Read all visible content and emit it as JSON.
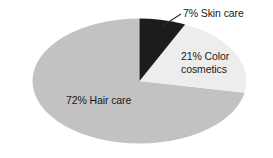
{
  "chart_data": {
    "type": "pie",
    "title": "",
    "subtitle": "",
    "xlabel": "",
    "ylabel": "",
    "legend_position": "none",
    "grid": false,
    "labels_inside": true,
    "start_angle_deg": 0,
    "direction": "clockwise",
    "categories": [
      "Skin care",
      "Color cosmetics",
      "Hair care"
    ],
    "values": [
      7,
      21,
      72
    ],
    "units": "percent",
    "colors": [
      "#1c1c1c",
      "#ededed",
      "#c2c2c2"
    ],
    "slices": [
      {
        "name": "Skin care",
        "value": 7,
        "label": "7% Skin care",
        "color": "#1c1c1c",
        "label_placement": "outside-leader",
        "has_leader_line": true
      },
      {
        "name": "Color cosmetics",
        "value": 21,
        "label_line1": "21% Color",
        "label_line2": "cosmetics",
        "color": "#ededed",
        "label_placement": "inside",
        "has_leader_line": false
      },
      {
        "name": "Hair care",
        "value": 72,
        "label": "72% Hair care",
        "color": "#c2c2c2",
        "label_placement": "inside",
        "has_leader_line": false
      }
    ]
  },
  "style": {
    "background": "#ffffff",
    "text_color": "#1a1a1a",
    "leader_line_color": "#2b2b2b"
  }
}
